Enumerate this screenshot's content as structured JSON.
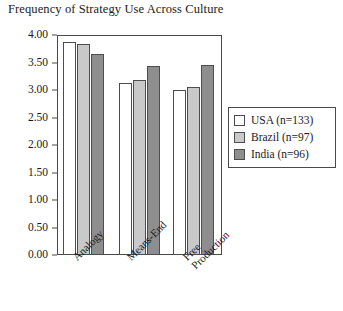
{
  "chart_data": {
    "type": "bar",
    "title": "Frequency of Strategy Use Across Culture",
    "xlabel": "",
    "ylabel": "",
    "ylim": [
      0,
      4
    ],
    "ytick_step": 0.5,
    "yticks": [
      "4.00",
      "3.50",
      "3.00",
      "2.50",
      "2.00",
      "1.50",
      "1.00",
      "0.50",
      "0.00"
    ],
    "grid": false,
    "legend_position": "right",
    "categories": [
      "Analogy",
      "Means-End",
      "Free Production"
    ],
    "category_lines": [
      [
        "Analogy"
      ],
      [
        "Means-End"
      ],
      [
        "Free",
        "Production"
      ]
    ],
    "series": [
      {
        "name": "USA (n=133)",
        "short": "USA",
        "n": 133,
        "color": "#ffffff",
        "values": [
          3.88,
          3.12,
          3.0
        ]
      },
      {
        "name": "Brazil (n=97)",
        "short": "Brazil",
        "n": 97,
        "color": "#c9c9c9",
        "values": [
          3.83,
          3.18,
          3.05
        ]
      },
      {
        "name": "India (n=96)",
        "short": "India",
        "n": 96,
        "color": "#8e8e8e",
        "values": [
          3.66,
          3.43,
          3.45
        ]
      }
    ]
  },
  "legend": {
    "items": [
      {
        "label": "USA (n=133)"
      },
      {
        "label": "Brazil (n=97)"
      },
      {
        "label": "India (n=96)"
      }
    ]
  },
  "colors": {
    "series_usa": "#ffffff",
    "series_brazil": "#c9c9c9",
    "series_india": "#8e8e8e",
    "axis": "#4a4a4a",
    "text": "#1a1a1a",
    "background": "#ffffff"
  }
}
